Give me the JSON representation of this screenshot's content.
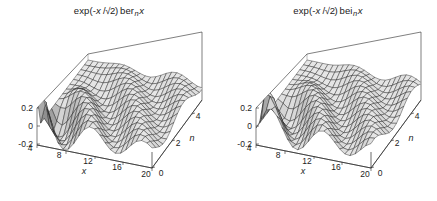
{
  "figure": {
    "background_color": "#ffffff",
    "panel_count": 2
  },
  "chart_data": [
    {
      "type": "surface",
      "panel": "left",
      "title": "exp(-x /√2) ber n x",
      "title_parts": {
        "prefix": "exp(-",
        "var": "x",
        "divider": " /√2) ",
        "func": "ber",
        "order": "n",
        "arg": "x"
      },
      "xlabel": "x",
      "ylabel": "n",
      "zlabel": "",
      "xticks": [
        "4",
        "8",
        "12",
        "16",
        "20"
      ],
      "xtick_values": [
        4,
        8,
        12,
        16,
        20
      ],
      "yticks": [
        "0",
        "2",
        "4"
      ],
      "ytick_values": [
        0,
        2,
        4
      ],
      "zticks": [
        "0.2",
        "0",
        "-0.2"
      ],
      "ztick_values": [
        0.2,
        0,
        -0.2
      ],
      "xlim": [
        0,
        20
      ],
      "ylim": [
        0,
        5
      ],
      "zlim": [
        -0.3,
        0.3
      ],
      "grid": true,
      "mesh": "wireframe-shaded",
      "colormap": "grayscale",
      "legend": "none",
      "description": "Damped Kelvin function exp(-x/sqrt(2)) ber_n(x) over x and order n",
      "surface_function": "ber"
    },
    {
      "type": "surface",
      "panel": "right",
      "title": "exp(-x /√2) bei n x",
      "title_parts": {
        "prefix": "exp(-",
        "var": "x",
        "divider": " /√2) ",
        "func": "bei",
        "order": "n",
        "arg": "x"
      },
      "xlabel": "x",
      "ylabel": "n",
      "zlabel": "",
      "xticks": [
        "4",
        "8",
        "12",
        "16",
        "20"
      ],
      "xtick_values": [
        4,
        8,
        12,
        16,
        20
      ],
      "yticks": [
        "0",
        "2",
        "4"
      ],
      "ytick_values": [
        0,
        2,
        4
      ],
      "zticks": [
        "0.2",
        "0",
        "-0.2"
      ],
      "ztick_values": [
        0.2,
        0,
        -0.2
      ],
      "xlim": [
        0,
        20
      ],
      "ylim": [
        0,
        5
      ],
      "zlim": [
        -0.3,
        0.3
      ],
      "grid": true,
      "mesh": "wireframe-shaded",
      "colormap": "grayscale",
      "legend": "none",
      "description": "Damped Kelvin function exp(-x/sqrt(2)) bei_n(x) over x and order n",
      "surface_function": "bei"
    }
  ]
}
